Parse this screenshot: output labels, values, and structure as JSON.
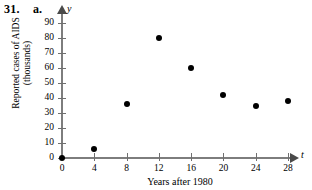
{
  "problem": {
    "number": "31.",
    "part": "a."
  },
  "chart_data": {
    "type": "scatter",
    "title": "",
    "xlabel": "Years after 1980",
    "ylabel": "Reported cases of AIDS (thousands)",
    "ylabel_line1": "Reported cases of AIDS",
    "ylabel_line2": "(thousands)",
    "x_axis_variable": "t",
    "y_axis_variable": "y",
    "xlim": [
      0,
      30
    ],
    "ylim": [
      0,
      95
    ],
    "xticks": [
      0,
      4,
      8,
      12,
      16,
      20,
      24,
      28
    ],
    "xtick_labels": [
      "0",
      "4",
      "8",
      "12",
      "16",
      "20",
      "24",
      "28"
    ],
    "yticks": [
      0,
      10,
      20,
      30,
      40,
      50,
      60,
      70,
      80,
      90
    ],
    "ytick_labels": [
      "0",
      "10",
      "20",
      "30",
      "40",
      "50",
      "60",
      "70",
      "80",
      "90"
    ],
    "grid": false,
    "legend": false,
    "x": [
      0,
      4,
      8,
      12,
      16,
      20,
      24,
      28
    ],
    "values": [
      0,
      6,
      36,
      80,
      60,
      42,
      35,
      38
    ],
    "points": [
      {
        "x": 0,
        "y": 0
      },
      {
        "x": 4,
        "y": 6
      },
      {
        "x": 8,
        "y": 36
      },
      {
        "x": 12,
        "y": 80
      },
      {
        "x": 16,
        "y": 60
      },
      {
        "x": 20,
        "y": 42
      },
      {
        "x": 24,
        "y": 35
      },
      {
        "x": 28,
        "y": 38
      }
    ],
    "marker_color": "#000000",
    "axis_color": "#7d7d7d"
  }
}
